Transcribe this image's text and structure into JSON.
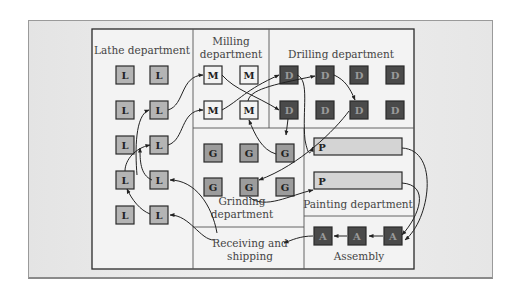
{
  "departments": {
    "lathe": {
      "label": "Lathe department",
      "symbol": "L"
    },
    "milling": {
      "label_lines": [
        "Milling",
        "department"
      ],
      "symbol": "M"
    },
    "drilling": {
      "label": "Drilling department",
      "symbol": "D"
    },
    "grinding": {
      "label_lines": [
        "Grinding",
        "department"
      ],
      "symbol": "G"
    },
    "painting": {
      "label": "Painting department",
      "symbol": "P"
    },
    "assembly": {
      "label": "Assembly",
      "symbol": "A"
    },
    "receiving": {
      "label_lines": [
        "Receiving and",
        "shipping"
      ]
    }
  },
  "colors": {
    "lathe_fill": "#b4b4b4",
    "milling_fill": "#f2f2f2",
    "drilling_fill": "#4a4a4a",
    "grinding_fill": "#9c9c9c",
    "painting_fill": "#d4d4d4",
    "assembly_fill": "#4a4a4a",
    "border": "#2a2a2a",
    "frame_bg": "#f3f3f3"
  }
}
